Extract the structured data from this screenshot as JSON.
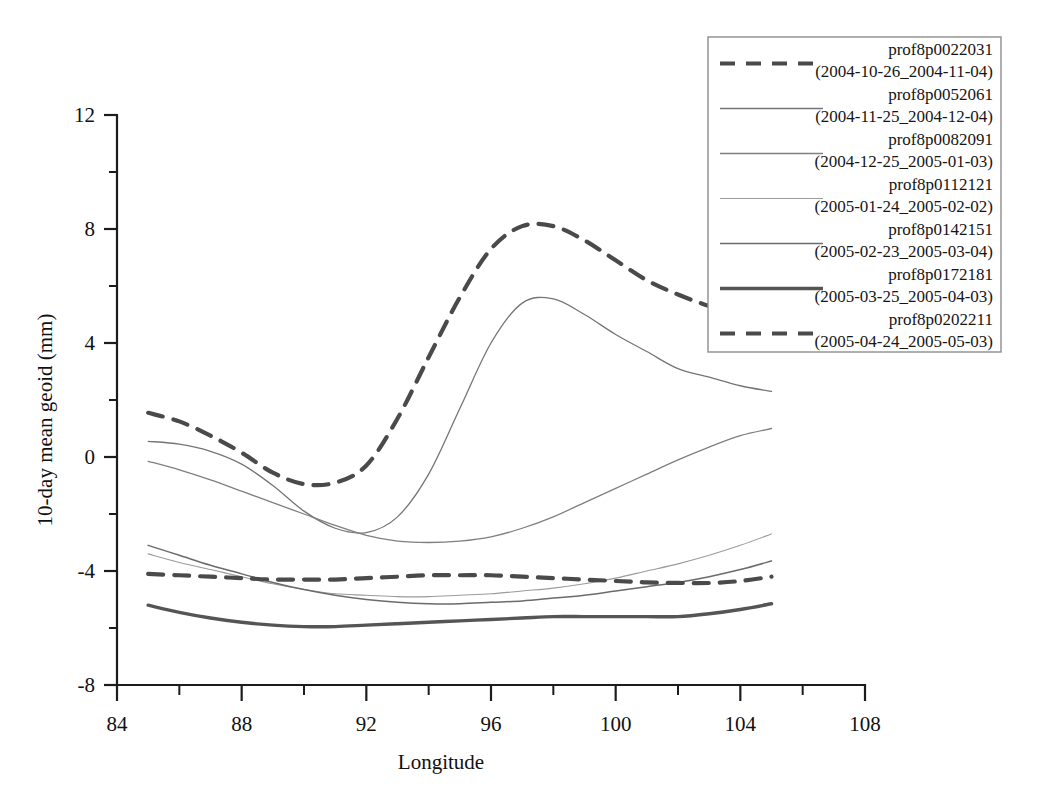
{
  "chart_data": {
    "type": "line",
    "title": "",
    "xlabel": "Longitude",
    "ylabel": "10-day mean geoid (mm)",
    "xlim": [
      84,
      108
    ],
    "ylim": [
      -8,
      12
    ],
    "xticks": [
      84,
      88,
      92,
      96,
      100,
      104,
      108
    ],
    "xtick_labels": [
      "84",
      "88",
      "92",
      "96",
      "100",
      "104",
      "108"
    ],
    "x_minor_ticks": [
      86,
      90,
      94,
      98,
      102,
      106
    ],
    "yticks": [
      12,
      8,
      4,
      0,
      -4,
      -8
    ],
    "ytick_labels": [
      "12",
      "8",
      "4",
      "0",
      "-4",
      "-8"
    ],
    "y_minor_ticks": [
      10,
      6,
      2,
      -2,
      -6
    ],
    "grid": false,
    "legend_position": "top-right",
    "x": [
      85.0,
      86.0,
      87.0,
      88.0,
      89.0,
      90.0,
      91.0,
      92.0,
      93.0,
      94.0,
      95.0,
      96.0,
      97.0,
      98.0,
      99.0,
      100.0,
      101.0,
      102.0,
      103.0,
      104.0,
      105.0
    ],
    "series": [
      {
        "name": "prof8p0022031",
        "period": "(2004-10-26_2004-11-04)",
        "style": "dashed",
        "width": 4.2,
        "color": "#4a4a4a",
        "values": [
          1.55,
          1.25,
          0.75,
          0.15,
          -0.55,
          -0.95,
          -0.9,
          -0.3,
          1.35,
          3.5,
          5.6,
          7.3,
          8.1,
          8.1,
          7.6,
          6.9,
          6.2,
          5.7,
          5.3,
          5.0,
          4.5
        ]
      },
      {
        "name": "prof8p0052061",
        "period": "(2004-11-25_2004-12-04)",
        "style": "solid",
        "width": 1.3,
        "color": "#757575",
        "values": [
          0.55,
          0.45,
          0.2,
          -0.25,
          -1.0,
          -1.9,
          -2.5,
          -2.65,
          -2.1,
          -0.6,
          1.7,
          4.0,
          5.4,
          5.55,
          5.0,
          4.3,
          3.7,
          3.1,
          2.8,
          2.5,
          2.3
        ]
      },
      {
        "name": "prof8p0082091",
        "period": "(2004-12-25_2005-01-03)",
        "style": "solid",
        "width": 1.3,
        "color": "#7f7f7f",
        "values": [
          -0.15,
          -0.45,
          -0.8,
          -1.2,
          -1.6,
          -2.0,
          -2.4,
          -2.75,
          -2.95,
          -3.0,
          -2.95,
          -2.8,
          -2.5,
          -2.1,
          -1.6,
          -1.1,
          -0.6,
          -0.1,
          0.35,
          0.75,
          1.0
        ]
      },
      {
        "name": "prof8p0112121",
        "period": "(2005-01-24_2005-02-02)",
        "style": "solid",
        "width": 1.1,
        "color": "#9b9b9b",
        "values": [
          -3.4,
          -3.7,
          -3.95,
          -4.2,
          -4.45,
          -4.65,
          -4.8,
          -4.85,
          -4.9,
          -4.9,
          -4.85,
          -4.8,
          -4.7,
          -4.6,
          -4.45,
          -4.25,
          -4.0,
          -3.75,
          -3.45,
          -3.1,
          -2.7
        ]
      },
      {
        "name": "prof8p0142151",
        "period": "(2005-02-23_2005-03-04)",
        "style": "solid",
        "width": 1.5,
        "color": "#6b6b6b",
        "values": [
          -3.1,
          -3.45,
          -3.8,
          -4.1,
          -4.4,
          -4.65,
          -4.85,
          -5.0,
          -5.1,
          -5.15,
          -5.15,
          -5.1,
          -5.05,
          -4.95,
          -4.85,
          -4.7,
          -4.55,
          -4.4,
          -4.2,
          -3.95,
          -3.65
        ]
      },
      {
        "name": "prof8p0172181",
        "period": "(2005-03-25_2005-04-03)",
        "style": "solid",
        "width": 3.4,
        "color": "#555555",
        "values": [
          -5.2,
          -5.45,
          -5.65,
          -5.8,
          -5.9,
          -5.95,
          -5.95,
          -5.9,
          -5.85,
          -5.8,
          -5.75,
          -5.7,
          -5.65,
          -5.6,
          -5.6,
          -5.6,
          -5.6,
          -5.6,
          -5.5,
          -5.35,
          -5.15
        ]
      },
      {
        "name": "prof8p0202211",
        "period": "(2005-04-24_2005-05-03)",
        "style": "dashed",
        "width": 4.2,
        "color": "#4a4a4a",
        "values": [
          -4.1,
          -4.15,
          -4.2,
          -4.25,
          -4.3,
          -4.3,
          -4.3,
          -4.25,
          -4.2,
          -4.15,
          -4.15,
          -4.15,
          -4.2,
          -4.25,
          -4.3,
          -4.35,
          -4.4,
          -4.42,
          -4.42,
          -4.35,
          -4.2
        ]
      }
    ]
  },
  "legend": {
    "entries": [
      {
        "name": "prof8p0022031",
        "period": "(2004-10-26_2004-11-04)"
      },
      {
        "name": "prof8p0052061",
        "period": "(2004-11-25_2004-12-04)"
      },
      {
        "name": "prof8p0082091",
        "period": "(2004-12-25_2005-01-03)"
      },
      {
        "name": "prof8p0112121",
        "period": "(2005-01-24_2005-02-02)"
      },
      {
        "name": "prof8p0142151",
        "period": "(2005-02-23_2005-03-04)"
      },
      {
        "name": "prof8p0172181",
        "period": "(2005-03-25_2005-04-03)"
      },
      {
        "name": "prof8p0202211",
        "period": "(2005-04-24_2005-05-03)"
      }
    ]
  }
}
